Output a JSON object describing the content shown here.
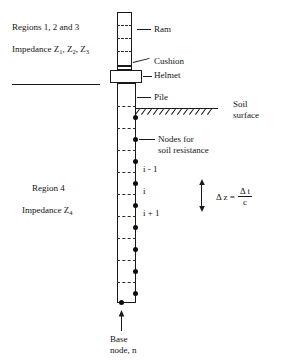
{
  "diagram": {
    "labels": {
      "regions_123": "Regions 1, 2 and 3",
      "impedance_123_prefix": "Impedance Z",
      "impedance_123": "Impedance Z1, Z2, Z3",
      "region_4": "Region 4",
      "impedance_4": "Impedance Z4",
      "ram": "Ram",
      "cushion": "Cushion",
      "helmet": "Helmet",
      "pile": "Pile",
      "soil_surface_line1": "Soil",
      "soil_surface_line2": "surface",
      "nodes_line1": "Nodes for",
      "nodes_line2": "soil resistance",
      "node_i_minus_1": "i - 1",
      "node_i": "i",
      "node_i_plus_1": "i + 1",
      "base_line1": "Base",
      "base_line2": "node, n"
    },
    "subscripts": {
      "z1": "1",
      "z2": "2",
      "z3": "3",
      "z4": "4"
    },
    "equation": {
      "lhs": "Δ z =",
      "numerator": "Δ t",
      "denominator": "c"
    },
    "colors": {
      "stroke": "#1a1a1a",
      "node_fill": "#0d0d0d",
      "background": "#ffffff",
      "text": "#141414"
    }
  }
}
